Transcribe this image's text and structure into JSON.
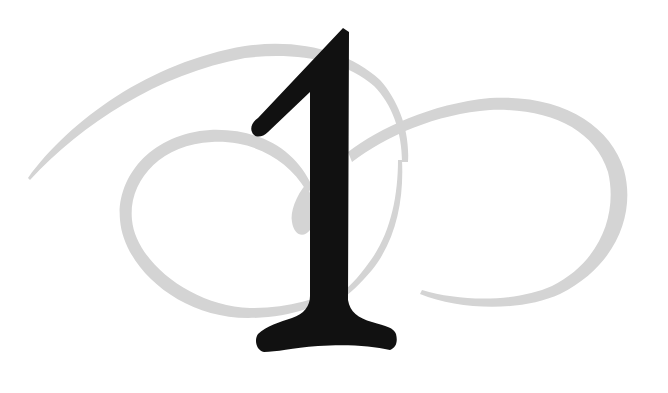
{
  "graphic": {
    "numeral": "1",
    "description": "Decorative chapter numeral over calligraphic swirl ornament",
    "colors": {
      "background": "#ffffff",
      "numeral": "#111111",
      "swirl": "#d4d4d4"
    }
  }
}
